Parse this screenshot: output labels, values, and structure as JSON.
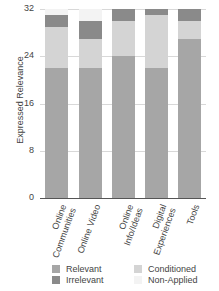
{
  "chart_data": {
    "type": "bar",
    "stacked": true,
    "title": "",
    "xlabel": "",
    "ylabel": "Expressed Relevance",
    "ylim": [
      0,
      32
    ],
    "yticks": [
      0,
      8,
      16,
      24,
      32
    ],
    "grid": true,
    "legend_position": "bottom",
    "categories": [
      "Online Communities",
      "Online Video",
      "Online Info/Ideas",
      "Digital Experiences",
      "Tools"
    ],
    "series": [
      {
        "name": "Relevant",
        "color": "#a6a6a6",
        "values": [
          22,
          22,
          24,
          22,
          27
        ]
      },
      {
        "name": "Conditioned",
        "color": "#d4d4d4",
        "values": [
          7,
          5,
          6,
          9,
          3
        ]
      },
      {
        "name": "Irrelevant",
        "color": "#8a8a8a",
        "values": [
          2,
          3,
          2,
          1,
          2
        ]
      },
      {
        "name": "Non-Applied",
        "color": "#f3f3f3",
        "values": [
          1,
          2,
          0,
          0,
          0
        ]
      }
    ]
  },
  "labels": {
    "ylabel": "Expressed Relevance",
    "yticks": [
      "0",
      "8",
      "16",
      "24",
      "32"
    ],
    "x": [
      "Online\nCommunities",
      "Online Video",
      "Online\nInfo/Ideas",
      "Digital\nExperiences",
      "Tools"
    ]
  },
  "legend": [
    {
      "label": "Relevant",
      "color": "#a6a6a6"
    },
    {
      "label": "Irrelevant",
      "color": "#8a8a8a"
    },
    {
      "label": "Conditioned",
      "color": "#d4d4d4"
    },
    {
      "label": "Non-Applied",
      "color": "#f3f3f3"
    }
  ]
}
